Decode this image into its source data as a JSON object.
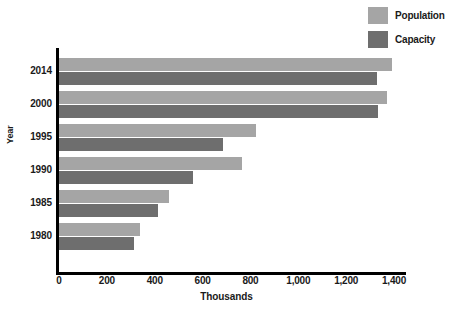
{
  "chart_data": {
    "type": "bar",
    "orientation": "horizontal",
    "title": "",
    "xlabel": "Thousands",
    "ylabel": "Year",
    "categories": [
      "2014",
      "2000",
      "1995",
      "1990",
      "1985",
      "1980"
    ],
    "series": [
      {
        "name": "Population",
        "color": "#a5a5a5",
        "values": [
          1390,
          1370,
          825,
          765,
          460,
          340
        ]
      },
      {
        "name": "Capacity",
        "color": "#6e6e6e",
        "values": [
          1330,
          1335,
          685,
          560,
          415,
          315
        ]
      }
    ],
    "xticks": [
      "0",
      "200",
      "400",
      "600",
      "800",
      "1,000",
      "1,200",
      "1,400"
    ],
    "xtick_values": [
      0,
      200,
      400,
      600,
      800,
      1000,
      1200,
      1400
    ],
    "xlim": [
      0,
      1400
    ],
    "grid": false,
    "legend_position": "top-right",
    "legend_entries": [
      "Population",
      "Capacity"
    ]
  },
  "legend": {
    "entries": [
      {
        "label": "Population",
        "color": "#a5a5a5"
      },
      {
        "label": "Capacity",
        "color": "#6e6e6e"
      }
    ]
  },
  "axes": {
    "y_title": "Year",
    "x_title": "Thousands",
    "axis_color": "#000000"
  }
}
